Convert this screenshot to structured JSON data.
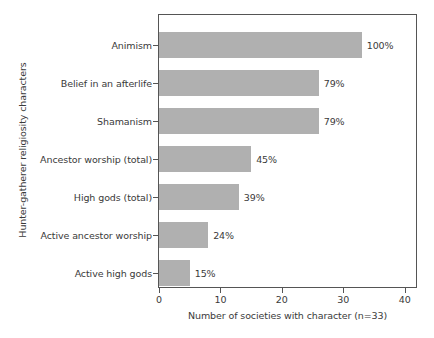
{
  "chart_data": {
    "type": "bar",
    "orientation": "horizontal",
    "title": "",
    "xlabel": "Number of societies with character (n=33)",
    "ylabel": "Hunter-gatherer religiosity characters",
    "categories": [
      "Animism",
      "Belief in an afterlife",
      "Shamanism",
      "Ancestor worship (total)",
      "High gods (total)",
      "Active ancestor worship",
      "Active high gods"
    ],
    "values": [
      33,
      26,
      26,
      15,
      13,
      8,
      5
    ],
    "data_labels": [
      "100%",
      "79%",
      "79%",
      "45%",
      "39%",
      "24%",
      "15%"
    ],
    "xlim": [
      0,
      42
    ],
    "xticks": [
      0,
      10,
      20,
      30,
      40
    ],
    "xtick_labels": [
      "0",
      "10",
      "20",
      "30",
      "40"
    ],
    "grid": false,
    "legend": null,
    "n": 33,
    "colors": {
      "bar_fill": "#b0b0b0",
      "frame": "#555555",
      "text": "#3a3a3a",
      "background": "#ffffff"
    }
  }
}
